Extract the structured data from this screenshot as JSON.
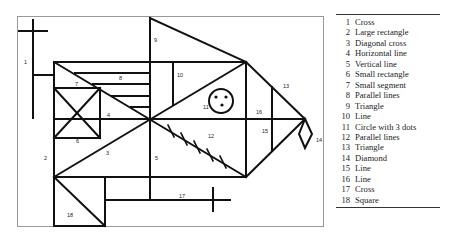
{
  "figure": {
    "labels": [
      {
        "n": "1",
        "x": 24,
        "y": 64
      },
      {
        "n": "2",
        "x": 44,
        "y": 160
      },
      {
        "n": "3",
        "x": 106,
        "y": 155
      },
      {
        "n": "4",
        "x": 107,
        "y": 117
      },
      {
        "n": "5",
        "x": 155,
        "y": 160
      },
      {
        "n": "6",
        "x": 76,
        "y": 143
      },
      {
        "n": "7",
        "x": 75,
        "y": 86
      },
      {
        "n": "8",
        "x": 119,
        "y": 80
      },
      {
        "n": "9",
        "x": 154,
        "y": 42
      },
      {
        "n": "10",
        "x": 177,
        "y": 77
      },
      {
        "n": "11",
        "x": 203,
        "y": 109
      },
      {
        "n": "12",
        "x": 208,
        "y": 138
      },
      {
        "n": "13",
        "x": 283,
        "y": 88
      },
      {
        "n": "14",
        "x": 316,
        "y": 142
      },
      {
        "n": "15",
        "x": 262,
        "y": 133
      },
      {
        "n": "16",
        "x": 256,
        "y": 114
      },
      {
        "n": "17",
        "x": 179,
        "y": 198
      },
      {
        "n": "18",
        "x": 67,
        "y": 217
      }
    ]
  },
  "legend": {
    "items": [
      {
        "num": "1",
        "label": "Cross"
      },
      {
        "num": "2",
        "label": "Large rectangle"
      },
      {
        "num": "3",
        "label": "Diagonal cross"
      },
      {
        "num": "4",
        "label": "Horizontal line"
      },
      {
        "num": "5",
        "label": "Vertical line"
      },
      {
        "num": "6",
        "label": "Small rectangle"
      },
      {
        "num": "7",
        "label": "Small segment"
      },
      {
        "num": "8",
        "label": "Parallel lines"
      },
      {
        "num": "9",
        "label": "Triangle"
      },
      {
        "num": "10",
        "label": "Line"
      },
      {
        "num": "11",
        "label": "Circle with 3 dots"
      },
      {
        "num": "12",
        "label": "Parallel lines"
      },
      {
        "num": "13",
        "label": "Triangle"
      },
      {
        "num": "14",
        "label": "Diamond"
      },
      {
        "num": "15",
        "label": "Line"
      },
      {
        "num": "16",
        "label": "Line"
      },
      {
        "num": "17",
        "label": "Cross"
      },
      {
        "num": "18",
        "label": "Square"
      }
    ]
  }
}
